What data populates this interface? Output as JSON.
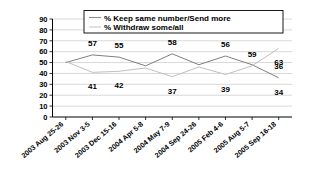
{
  "chart_data": {
    "type": "line",
    "title": "",
    "xlabel": "",
    "ylabel": "",
    "ylim": [
      0,
      90
    ],
    "ytick_step": 10,
    "yticks": [
      "90",
      "80",
      "70",
      "60",
      "50",
      "40",
      "30",
      "20",
      "10",
      "0"
    ],
    "grid": true,
    "legend_position": "top-center",
    "categories": [
      "2003 Aug 25-26",
      "2003 Nov 3-5",
      "2003 Dec 15-16",
      "2004 Apr 5-8",
      "2004 May 7-9",
      "2004 Sep 24-26",
      "2005 Feb 4-6",
      "2005 Aug 5-7",
      "2005 Sep 16-18"
    ],
    "series": [
      {
        "name": "% Keep same number/Send more",
        "color": "#7f7f7f",
        "values": [
          50,
          57,
          55,
          47,
          58,
          48,
          56,
          48,
          36
        ],
        "labels": [
          "",
          "57",
          "55",
          "",
          "58",
          "",
          "56",
          "",
          "36"
        ],
        "label_side": "above"
      },
      {
        "name": "% Withdraw some/all",
        "color": "#c0c0c0",
        "values": [
          51,
          41,
          42,
          45,
          37,
          46,
          39,
          47,
          63
        ],
        "labels": [
          "",
          "41",
          "42",
          "",
          "37",
          "",
          "39",
          "",
          "63"
        ],
        "label_side": "below"
      }
    ],
    "extra_labels": [
      {
        "text": "59",
        "series": 1,
        "index": 7,
        "position": "above"
      },
      {
        "text": "34",
        "series": 0,
        "index": 8,
        "position": "below"
      }
    ]
  },
  "legend": {
    "items": [
      {
        "label": "% Keep same number/Send more",
        "color": "#8c8c8c"
      },
      {
        "label": "% Withdraw some/all",
        "color": "#c8c8c8"
      }
    ]
  },
  "axis": {
    "y_labels": [
      "90",
      "80",
      "70",
      "60",
      "50",
      "40",
      "30",
      "20",
      "10",
      "0"
    ],
    "x_labels": [
      "2003 Aug 25-26",
      "2003 Nov 3-5",
      "2003 Dec 15-16",
      "2004 Apr 5-8",
      "2004 May 7-9",
      "2004 Sep 24-26",
      "2005 Feb 4-6",
      "2005 Aug 5-7",
      "2005 Sep 16-18"
    ]
  },
  "data_labels": {
    "upper": [
      "57",
      "55",
      "58",
      "56",
      "59",
      "63"
    ],
    "lower": [
      "41",
      "42",
      "37",
      "39",
      "36",
      "34"
    ]
  }
}
